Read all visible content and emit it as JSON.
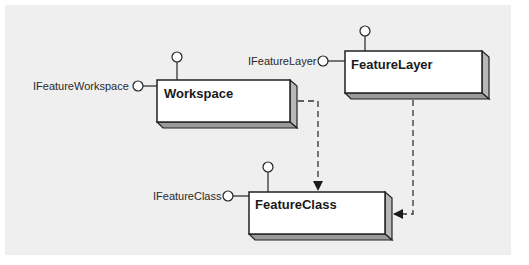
{
  "diagram": {
    "type": "uml-class-interface-diagram",
    "classes": [
      {
        "id": "workspace",
        "name": "Workspace",
        "interfaces": [
          "IFeatureWorkspace"
        ]
      },
      {
        "id": "featurelayer",
        "name": "FeatureLayer",
        "interfaces": [
          "IFeatureLayer"
        ]
      },
      {
        "id": "featureclass",
        "name": "FeatureClass",
        "interfaces": [
          "IFeatureClass"
        ]
      }
    ],
    "relationships": [
      {
        "from": "workspace",
        "to": "featureclass",
        "style": "dashed-arrow"
      },
      {
        "from": "featurelayer",
        "to": "featureclass",
        "style": "dashed-arrow"
      }
    ]
  },
  "labels": {
    "workspace": "Workspace",
    "featurelayer": "FeatureLayer",
    "featureclass": "FeatureClass",
    "ifeatureworkspace": "IFeatureWorkspace",
    "ifeaturelayer": "IFeatureLayer",
    "ifeatureclass": "IFeatureClass"
  },
  "colors": {
    "background": "#efefef",
    "box_fill": "#ffffff",
    "box_side": "#b8b8b8",
    "stroke": "#222222"
  }
}
